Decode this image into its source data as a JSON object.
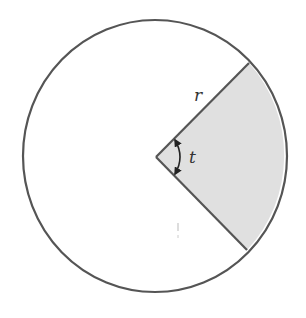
{
  "diagram": {
    "labels": {
      "radius": "r",
      "angle": "t"
    },
    "colors": {
      "stroke": "#555555",
      "sector_fill": "#e0e0e0",
      "background": "#ffffff",
      "text": "#333333"
    },
    "shapes": {
      "circle": {
        "cx": 155,
        "cy": 156,
        "rx": 132,
        "ry": 136
      },
      "center": {
        "x": 156,
        "y": 157
      },
      "radius_end_upper": {
        "x": 249,
        "y": 63
      },
      "radius_end_lower": {
        "x": 247,
        "y": 250
      }
    }
  }
}
